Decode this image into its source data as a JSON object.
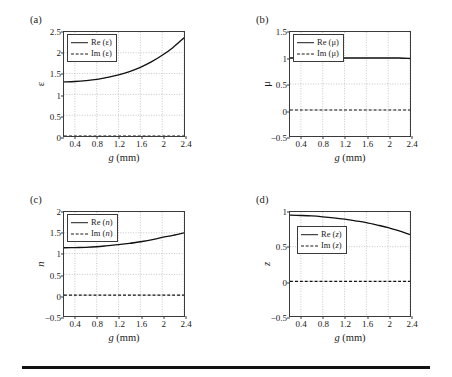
{
  "figure": {
    "panels": [
      {
        "tag": "(a)",
        "ylabel": "ε",
        "ylabel_italic": false,
        "xlabel_var": "g",
        "xlabel_unit": "(mm)",
        "legend": [
          {
            "label_prefix": "Re (",
            "symbol": "ε",
            "label_suffix": ")",
            "style": "solid",
            "symbol_italic": false
          },
          {
            "label_prefix": "Im (",
            "symbol": "ε",
            "label_suffix": ")",
            "style": "dashed",
            "symbol_italic": false
          }
        ]
      },
      {
        "tag": "(b)",
        "ylabel": "μ",
        "ylabel_italic": false,
        "xlabel_var": "g",
        "xlabel_unit": "(mm)",
        "legend": [
          {
            "label_prefix": "Re (",
            "symbol": "μ",
            "label_suffix": ")",
            "style": "solid",
            "symbol_italic": false
          },
          {
            "label_prefix": "Im (",
            "symbol": "μ",
            "label_suffix": ")",
            "style": "dashed",
            "symbol_italic": false
          }
        ]
      },
      {
        "tag": "(c)",
        "ylabel": "n",
        "ylabel_italic": true,
        "xlabel_var": "g",
        "xlabel_unit": "(mm)",
        "legend": [
          {
            "label_prefix": "Re (",
            "symbol": "n",
            "label_suffix": ")",
            "style": "solid",
            "symbol_italic": true
          },
          {
            "label_prefix": "Im (",
            "symbol": "n",
            "label_suffix": ")",
            "style": "dashed",
            "symbol_italic": true
          }
        ]
      },
      {
        "tag": "(d)",
        "ylabel": "z",
        "ylabel_italic": true,
        "xlabel_var": "g",
        "xlabel_unit": "(mm)",
        "legend": [
          {
            "label_prefix": "Re (",
            "symbol": "z",
            "label_suffix": ")",
            "style": "solid",
            "symbol_italic": true
          },
          {
            "label_prefix": "Im (",
            "symbol": "z",
            "label_suffix": ")",
            "style": "dashed",
            "symbol_italic": true
          }
        ]
      }
    ]
  },
  "chart_data": [
    {
      "panel": "(a)",
      "type": "line",
      "title": "",
      "xlabel": "g (mm)",
      "ylabel": "ε",
      "xlim": [
        0.2,
        2.4
      ],
      "ylim": [
        0,
        2.5
      ],
      "xticks": [
        "0.4",
        "0.8",
        "1.2",
        "1.6",
        "2",
        "2.4"
      ],
      "xtick_values": [
        0.4,
        0.8,
        1.2,
        1.6,
        2.0,
        2.4
      ],
      "yticks": [
        "2.5",
        "2",
        "1.5",
        "1",
        "0.5",
        "0"
      ],
      "ytick_values": [
        2.5,
        2.0,
        1.5,
        1.0,
        0.5,
        0.0
      ],
      "grid": true,
      "legend_position": "upper-left",
      "x": [
        0.2,
        0.4,
        0.6,
        0.8,
        1.0,
        1.2,
        1.4,
        1.6,
        1.8,
        2.0,
        2.2,
        2.4
      ],
      "series": [
        {
          "name": "Re (ε)",
          "style": "solid",
          "values": [
            1.3,
            1.31,
            1.33,
            1.36,
            1.41,
            1.47,
            1.55,
            1.65,
            1.78,
            1.94,
            2.13,
            2.36
          ]
        },
        {
          "name": "Im (ε)",
          "style": "dashed",
          "values": [
            0,
            0,
            0,
            0,
            0,
            0,
            0,
            0,
            0,
            0,
            0,
            0
          ]
        }
      ]
    },
    {
      "panel": "(b)",
      "type": "line",
      "title": "",
      "xlabel": "g (mm)",
      "ylabel": "μ",
      "xlim": [
        0.2,
        2.4
      ],
      "ylim": [
        -0.5,
        1.5
      ],
      "xticks": [
        "0.4",
        "0.8",
        "1.2",
        "1.6",
        "2",
        "2.4"
      ],
      "xtick_values": [
        0.4,
        0.8,
        1.2,
        1.6,
        2.0,
        2.4
      ],
      "yticks": [
        "1.5",
        "1",
        "0.5",
        "0",
        "-0.5"
      ],
      "ytick_values": [
        1.5,
        1.0,
        0.5,
        0.0,
        -0.5
      ],
      "grid": true,
      "legend_position": "upper-left",
      "x": [
        0.2,
        0.4,
        0.6,
        0.8,
        1.0,
        1.2,
        1.4,
        1.6,
        1.8,
        2.0,
        2.2,
        2.4
      ],
      "series": [
        {
          "name": "Re (μ)",
          "style": "solid",
          "values": [
            1.0,
            1.0,
            1.0,
            1.0,
            1.0,
            1.0,
            1.0,
            1.0,
            1.0,
            1.0,
            1.0,
            0.99
          ]
        },
        {
          "name": "Im (μ)",
          "style": "dashed",
          "values": [
            0,
            0,
            0,
            0,
            0,
            0,
            0,
            0,
            0,
            0,
            0,
            0
          ]
        }
      ]
    },
    {
      "panel": "(c)",
      "type": "line",
      "title": "",
      "xlabel": "g (mm)",
      "ylabel": "n",
      "xlim": [
        0.2,
        2.4
      ],
      "ylim": [
        -0.5,
        2.0
      ],
      "xticks": [
        "0.4",
        "0.8",
        "1.2",
        "1.6",
        "2",
        "2.4"
      ],
      "xtick_values": [
        0.4,
        0.8,
        1.2,
        1.6,
        2.0,
        2.4
      ],
      "yticks": [
        "2",
        "1.5",
        "1",
        "0.5",
        "0",
        "-0.5"
      ],
      "ytick_values": [
        2.0,
        1.5,
        1.0,
        0.5,
        0.0,
        -0.5
      ],
      "grid": true,
      "legend_position": "upper-left",
      "x": [
        0.2,
        0.4,
        0.6,
        0.8,
        1.0,
        1.2,
        1.4,
        1.6,
        1.8,
        2.0,
        2.2,
        2.4
      ],
      "series": [
        {
          "name": "Re (n)",
          "style": "solid",
          "values": [
            1.14,
            1.145,
            1.15,
            1.165,
            1.19,
            1.215,
            1.245,
            1.285,
            1.33,
            1.39,
            1.44,
            1.5
          ]
        },
        {
          "name": "Im (n)",
          "style": "dashed",
          "values": [
            0,
            0,
            0,
            0,
            0,
            0,
            0,
            0,
            0,
            0,
            0,
            0
          ]
        }
      ]
    },
    {
      "panel": "(d)",
      "type": "line",
      "title": "",
      "xlabel": "g (mm)",
      "ylabel": "z",
      "xlim": [
        0.2,
        2.4
      ],
      "ylim": [
        -0.5,
        1.0
      ],
      "xticks": [
        "0.4",
        "0.8",
        "1.2",
        "1.6",
        "2",
        "2.4"
      ],
      "xtick_values": [
        0.4,
        0.8,
        1.2,
        1.6,
        2.0,
        2.4
      ],
      "yticks": [
        "1",
        "0.5",
        "0",
        "-0.5"
      ],
      "ytick_values": [
        1.0,
        0.5,
        0.0,
        -0.5
      ],
      "grid": true,
      "legend_position": "upper-left",
      "x": [
        0.2,
        0.4,
        0.6,
        0.8,
        1.0,
        1.2,
        1.4,
        1.6,
        1.8,
        2.0,
        2.2,
        2.4
      ],
      "series": [
        {
          "name": "Re (z)",
          "style": "solid",
          "values": [
            0.955,
            0.95,
            0.943,
            0.931,
            0.916,
            0.897,
            0.873,
            0.846,
            0.812,
            0.775,
            0.727,
            0.675
          ]
        },
        {
          "name": "Im (z)",
          "style": "dashed",
          "values": [
            0,
            0,
            0,
            0,
            0,
            0,
            0,
            0,
            0,
            0,
            0,
            0
          ]
        }
      ]
    }
  ]
}
